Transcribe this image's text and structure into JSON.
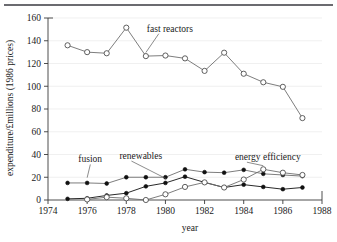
{
  "figure": {
    "name": "energy-rd-expenditure-chart",
    "has_top_rule": true
  },
  "chart_data": {
    "type": "line",
    "title": "",
    "xlabel": "year",
    "ylabel": "expenditure/£millions (1986 prices)",
    "xlim": [
      1974,
      1988
    ],
    "ylim": [
      0,
      160
    ],
    "xticks": [
      1974,
      1976,
      1978,
      1980,
      1982,
      1984,
      1986,
      1988
    ],
    "xticklabels": [
      "1974",
      "1976",
      "1978",
      "1980",
      "1982",
      "1984",
      "1986",
      "1988"
    ],
    "yticks": [
      0,
      20,
      40,
      60,
      80,
      100,
      120,
      140,
      160
    ],
    "yticklabels": [
      "0",
      "20",
      "40",
      "60",
      "80",
      "100",
      "120",
      "140",
      "160"
    ],
    "grid": "horizontal-faint",
    "legend": "inline-annotations",
    "marker_colors": {
      "open": "#ffffff",
      "filled": "#111111",
      "edge": "#444444",
      "line_light": "#6e6e6e",
      "line_dark": "#111111"
    },
    "series": [
      {
        "name": "fast reactors",
        "marker": "open-circle",
        "line_style": "light",
        "label_x": 1979.05,
        "label_y": 148,
        "leader_to_x": 1979.0,
        "leader_to_y": 127,
        "x": [
          1975,
          1976,
          1977,
          1978,
          1979,
          1980,
          1981,
          1982,
          1983,
          1984,
          1985,
          1986,
          1987
        ],
        "values": [
          136,
          130,
          129,
          151.5,
          126.5,
          127,
          124.5,
          113.5,
          129.5,
          111,
          103.5,
          99.5,
          72
        ]
      },
      {
        "name": "fusion",
        "marker": "filled-circle",
        "line_style": "light",
        "label_x": 1975.55,
        "label_y": 33,
        "leader_to_x": 1976.0,
        "leader_to_y": 17,
        "x": [
          1975,
          1976,
          1977,
          1978,
          1979,
          1980,
          1981,
          1982,
          1983,
          1984,
          1985,
          1986,
          1987
        ],
        "values": [
          15,
          15,
          14.5,
          20,
          20,
          20,
          27,
          24.5,
          24,
          26.5,
          23,
          22,
          21
        ]
      },
      {
        "name": "renewables",
        "marker": "filled-circle",
        "line_style": "dark",
        "label_x": 1977.65,
        "label_y": 36,
        "leader_to_x": 1980.05,
        "leader_to_y": 16,
        "x": [
          1975,
          1976,
          1977,
          1978,
          1979,
          1980,
          1981,
          1982,
          1983,
          1984,
          1985,
          1986,
          1987
        ],
        "values": [
          1,
          1.5,
          4,
          6,
          12,
          15,
          20.5,
          15.5,
          11,
          13.5,
          11.5,
          9.5,
          11
        ]
      },
      {
        "name": "energy efficiency",
        "marker": "open-circle",
        "line_style": "light",
        "label_x": 1983.55,
        "label_y": 35,
        "leader_to_x": 1985.0,
        "leader_to_y": 27.5,
        "x": [
          1976,
          1977,
          1978,
          1979,
          1980,
          1981,
          1982,
          1983,
          1984,
          1985,
          1986,
          1987
        ],
        "values": [
          0.5,
          2.5,
          1.5,
          0,
          5,
          11.5,
          15.5,
          11,
          18,
          27,
          24,
          22
        ]
      }
    ]
  }
}
